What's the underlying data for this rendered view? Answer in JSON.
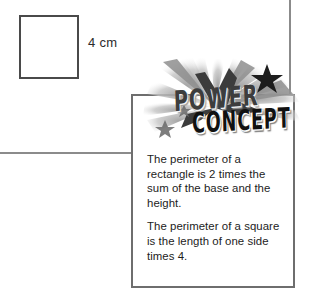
{
  "page": {
    "background_color": "#ffffff",
    "rules": [
      {
        "name": "vertical-page-rule",
        "color": "#8b8b8b"
      },
      {
        "name": "horizontal-page-rule",
        "color": "#8b8b8b"
      }
    ]
  },
  "figure": {
    "shape": "square",
    "shape_icon": "square-outline-icon",
    "border_color": "#4a4a4a",
    "fill_color": "#ffffff",
    "side_label": "4 cm"
  },
  "concept_card": {
    "border_color": "#6e6e6e",
    "background_color": "#ffffff",
    "logo": {
      "icon": "starburst-rays-icon",
      "star_icon": "star-icon",
      "line1": "POWER",
      "line2": "CONCEPT",
      "line1_color": "#3d3d3d",
      "line2_color": "#111111",
      "burst_color": "#c9c9c9"
    },
    "paragraphs": [
      "The perimeter of a rectangle is 2 times the sum of the base and the height.",
      "The perimeter of a square is the length of one side times 4."
    ]
  }
}
